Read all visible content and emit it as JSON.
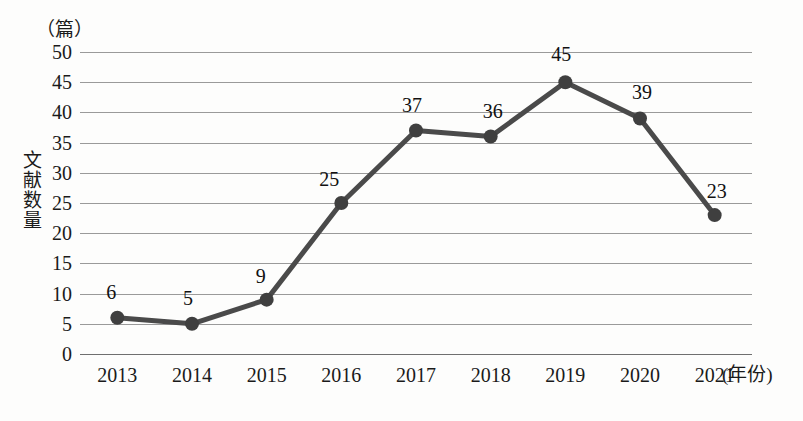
{
  "chart_data": {
    "type": "line",
    "title": "",
    "xlabel": "(年份)",
    "ylabel": "文献数量",
    "yunit": "（篇）",
    "categories": [
      "2013",
      "2014",
      "2015",
      "2016",
      "2017",
      "2018",
      "2019",
      "2020",
      "2021"
    ],
    "values": [
      6,
      5,
      9,
      25,
      37,
      36,
      45,
      39,
      23
    ],
    "labels": [
      "6",
      "5",
      "9",
      "25",
      "37",
      "36",
      "45",
      "39",
      "23"
    ],
    "series": [
      {
        "name": "文献数量",
        "values": [
          6,
          5,
          9,
          25,
          37,
          36,
          45,
          39,
          23
        ]
      }
    ],
    "ylim": [
      0,
      50
    ],
    "yticks": [
      "50",
      "45",
      "40",
      "35",
      "30",
      "25",
      "20",
      "15",
      "10",
      "5",
      "0"
    ],
    "ytick_values": [
      50,
      45,
      40,
      35,
      30,
      25,
      20,
      15,
      10,
      5,
      0
    ],
    "grid": true,
    "legend": false,
    "line_color": "#4a4a4a",
    "marker_color": "#3f3f3f",
    "grid_color": "#9a9a9a",
    "background": "#fdfdfc"
  }
}
